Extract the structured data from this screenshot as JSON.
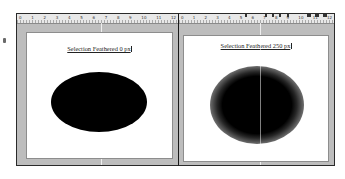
{
  "panels": [
    {
      "id": "left",
      "caption": "Selection Feathered 0 px",
      "ruler_labels": [
        "0",
        "1",
        "2",
        "3",
        "4",
        "5",
        "6",
        "7",
        "8",
        "9",
        "10",
        "11",
        "12"
      ],
      "shape": {
        "type": "ellipse",
        "fill": "#000000",
        "feather_px": 0
      }
    },
    {
      "id": "right",
      "caption": "Selection Feathered 250 px",
      "ruler_labels": [
        "0",
        "1",
        "2",
        "3",
        "4",
        "5",
        "6",
        "7",
        "8",
        "9",
        "10",
        "11",
        "12"
      ],
      "shape": {
        "type": "ellipse",
        "fill": "#000000",
        "feather_px": 250
      }
    }
  ],
  "colors": {
    "frame": "#bdbdbd",
    "canvas": "#ffffff",
    "ruler": "#e8e8e8",
    "border": "#2a2a2a"
  }
}
